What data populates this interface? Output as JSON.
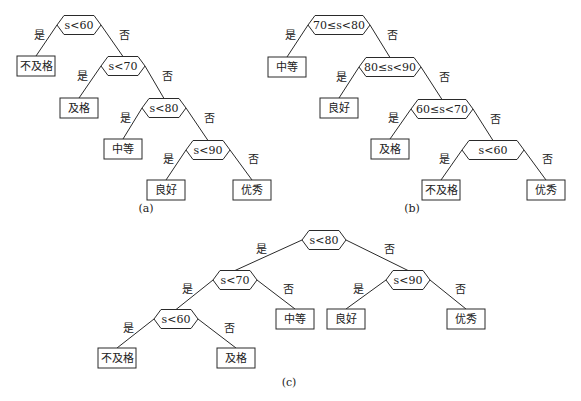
{
  "figure": {
    "colors": {
      "stroke": "#2a2a2a",
      "text": "#222222",
      "background": "#ffffff"
    },
    "trees": [
      {
        "id": "a",
        "caption": "(a)",
        "caption_pos": [
          146,
          212
        ],
        "nodes": [
          {
            "id": "a1",
            "type": "decision",
            "label": "s<60",
            "x": 79,
            "y": 25,
            "w": 44,
            "h": 19
          },
          {
            "id": "a2",
            "type": "leaf",
            "label": "不及格",
            "x": 36,
            "y": 66,
            "w": 38,
            "h": 20
          },
          {
            "id": "a3",
            "type": "decision",
            "label": "s<70",
            "x": 123,
            "y": 66,
            "w": 44,
            "h": 19
          },
          {
            "id": "a4",
            "type": "leaf",
            "label": "及格",
            "x": 79,
            "y": 108,
            "w": 38,
            "h": 20
          },
          {
            "id": "a5",
            "type": "decision",
            "label": "s<80",
            "x": 164,
            "y": 108,
            "w": 44,
            "h": 19
          },
          {
            "id": "a6",
            "type": "leaf",
            "label": "中等",
            "x": 123,
            "y": 149,
            "w": 38,
            "h": 20
          },
          {
            "id": "a7",
            "type": "decision",
            "label": "s<90",
            "x": 208,
            "y": 150,
            "w": 44,
            "h": 19
          },
          {
            "id": "a8",
            "type": "leaf",
            "label": "良好",
            "x": 166,
            "y": 190,
            "w": 38,
            "h": 20
          },
          {
            "id": "a9",
            "type": "leaf",
            "label": "优秀",
            "x": 252,
            "y": 190,
            "w": 38,
            "h": 20
          }
        ],
        "edges": [
          {
            "from": "a1",
            "to": "a2",
            "label": "是"
          },
          {
            "from": "a1",
            "to": "a3",
            "label": "否"
          },
          {
            "from": "a3",
            "to": "a4",
            "label": "是"
          },
          {
            "from": "a3",
            "to": "a5",
            "label": "否"
          },
          {
            "from": "a5",
            "to": "a6",
            "label": "是"
          },
          {
            "from": "a5",
            "to": "a7",
            "label": "否"
          },
          {
            "from": "a7",
            "to": "a8",
            "label": "是"
          },
          {
            "from": "a7",
            "to": "a9",
            "label": "否"
          }
        ]
      },
      {
        "id": "b",
        "caption": "(b)",
        "caption_pos": [
          412,
          212
        ],
        "nodes": [
          {
            "id": "b1",
            "type": "decision",
            "label": "70≤s<80",
            "x": 339,
            "y": 25,
            "w": 62,
            "h": 19
          },
          {
            "id": "b2",
            "type": "leaf",
            "label": "中等",
            "x": 287,
            "y": 67,
            "w": 38,
            "h": 20
          },
          {
            "id": "b3",
            "type": "decision",
            "label": "80≤s<90",
            "x": 390,
            "y": 67,
            "w": 62,
            "h": 19
          },
          {
            "id": "b4",
            "type": "leaf",
            "label": "良好",
            "x": 339,
            "y": 108,
            "w": 38,
            "h": 20
          },
          {
            "id": "b5",
            "type": "decision",
            "label": "60≤s<70",
            "x": 442,
            "y": 109,
            "w": 62,
            "h": 19
          },
          {
            "id": "b6",
            "type": "leaf",
            "label": "及格",
            "x": 390,
            "y": 149,
            "w": 38,
            "h": 20
          },
          {
            "id": "b7",
            "type": "decision",
            "label": "s<60",
            "x": 493,
            "y": 150,
            "w": 62,
            "h": 19
          },
          {
            "id": "b8",
            "type": "leaf",
            "label": "不及格",
            "x": 441,
            "y": 190,
            "w": 38,
            "h": 20
          },
          {
            "id": "b9",
            "type": "leaf",
            "label": "优秀",
            "x": 546,
            "y": 190,
            "w": 38,
            "h": 20
          }
        ],
        "edges": [
          {
            "from": "b1",
            "to": "b2",
            "label": "是"
          },
          {
            "from": "b1",
            "to": "b3",
            "label": "否"
          },
          {
            "from": "b3",
            "to": "b4",
            "label": "是"
          },
          {
            "from": "b3",
            "to": "b5",
            "label": "否"
          },
          {
            "from": "b5",
            "to": "b6",
            "label": "是"
          },
          {
            "from": "b5",
            "to": "b7",
            "label": "否"
          },
          {
            "from": "b7",
            "to": "b8",
            "label": "是"
          },
          {
            "from": "b7",
            "to": "b9",
            "label": "否"
          }
        ]
      },
      {
        "id": "c",
        "caption": "(c)",
        "caption_pos": [
          289,
          386
        ],
        "nodes": [
          {
            "id": "c1",
            "type": "decision",
            "label": "s<80",
            "x": 324,
            "y": 240,
            "w": 44,
            "h": 19
          },
          {
            "id": "c2",
            "type": "decision",
            "label": "s<70",
            "x": 235,
            "y": 280,
            "w": 44,
            "h": 19
          },
          {
            "id": "c3",
            "type": "decision",
            "label": "s<90",
            "x": 408,
            "y": 280,
            "w": 44,
            "h": 19
          },
          {
            "id": "c4",
            "type": "decision",
            "label": "s<60",
            "x": 176,
            "y": 319,
            "w": 44,
            "h": 19
          },
          {
            "id": "c5",
            "type": "leaf",
            "label": "中等",
            "x": 295,
            "y": 319,
            "w": 38,
            "h": 20
          },
          {
            "id": "c6",
            "type": "leaf",
            "label": "良好",
            "x": 346,
            "y": 319,
            "w": 38,
            "h": 20
          },
          {
            "id": "c7",
            "type": "leaf",
            "label": "优秀",
            "x": 466,
            "y": 319,
            "w": 38,
            "h": 20
          },
          {
            "id": "c8",
            "type": "leaf",
            "label": "不及格",
            "x": 117,
            "y": 358,
            "w": 38,
            "h": 20
          },
          {
            "id": "c9",
            "type": "leaf",
            "label": "及格",
            "x": 236,
            "y": 358,
            "w": 38,
            "h": 20
          }
        ],
        "edges": [
          {
            "from": "c1",
            "to": "c2",
            "label": "是"
          },
          {
            "from": "c1",
            "to": "c3",
            "label": "否"
          },
          {
            "from": "c2",
            "to": "c4",
            "label": "是"
          },
          {
            "from": "c2",
            "to": "c5",
            "label": "否"
          },
          {
            "from": "c3",
            "to": "c6",
            "label": "是"
          },
          {
            "from": "c3",
            "to": "c7",
            "label": "否"
          },
          {
            "from": "c4",
            "to": "c8",
            "label": "是"
          },
          {
            "from": "c4",
            "to": "c9",
            "label": "否"
          }
        ]
      }
    ]
  }
}
